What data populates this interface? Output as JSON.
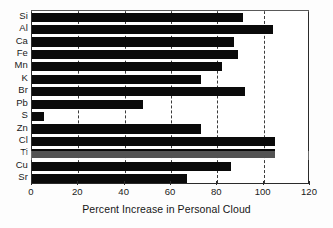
{
  "chart_data": {
    "type": "bar",
    "orientation": "horizontal",
    "title": "",
    "xlabel": "Percent Increase in Personal Cloud",
    "ylabel": "",
    "categories": [
      "Si",
      "Al",
      "Ca",
      "Fe",
      "Mn",
      "K",
      "Br",
      "Pb",
      "S",
      "Zn",
      "Cl",
      "Ti",
      "Cu",
      "Sr"
    ],
    "values": [
      91,
      104,
      87,
      89,
      82,
      73,
      92,
      48,
      5,
      73,
      105,
      105,
      86,
      67
    ],
    "xlim": [
      0,
      120
    ],
    "xticks": [
      0,
      20,
      40,
      60,
      80,
      100,
      120
    ],
    "gridlines": [
      20,
      40,
      60,
      80,
      100
    ],
    "grid": "vertical-dashed",
    "legend": "none",
    "bar_color": "#0a0a0a",
    "axis_color": "#2b2b2b"
  }
}
